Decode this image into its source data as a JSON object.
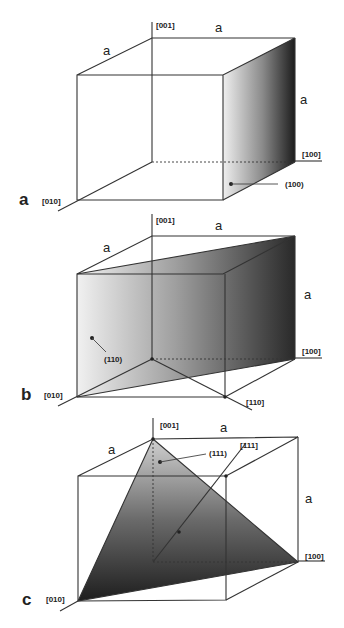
{
  "figure": {
    "panels": [
      {
        "id": "a",
        "panel_label": "a",
        "plane_label": "(100)",
        "axes": {
          "z": "[001]",
          "x": "[100]",
          "y": "[010]"
        },
        "edge_labels": [
          "a",
          "a",
          "a"
        ]
      },
      {
        "id": "b",
        "panel_label": "b",
        "plane_label": "(110)",
        "direction_label": "[110]",
        "axes": {
          "z": "[001]",
          "x": "[100]",
          "y": "[010]"
        },
        "edge_labels": [
          "a",
          "a",
          "a"
        ]
      },
      {
        "id": "c",
        "panel_label": "c",
        "plane_label": "(111)",
        "direction_label": "[111]",
        "axes": {
          "z": "[001]",
          "x": "[100]",
          "y": "[010]"
        },
        "edge_labels": [
          "a",
          "a",
          "a"
        ]
      }
    ],
    "colors": {
      "line": "#333333",
      "shade_light": "#f2f2f2",
      "shade_dark": "#1e1e1e"
    }
  }
}
